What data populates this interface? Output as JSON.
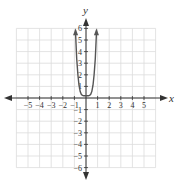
{
  "chart_data": {
    "type": "line",
    "title": "",
    "xlabel": "x",
    "ylabel": "y",
    "xlim": [
      -6,
      6
    ],
    "ylim": [
      -6,
      6
    ],
    "grid": true,
    "x_ticks": [
      "-5",
      "-4",
      "-3",
      "-2",
      "-1",
      "1",
      "2",
      "3",
      "4",
      "5"
    ],
    "y_ticks": [
      "6",
      "5",
      "4",
      "3",
      "2",
      "1",
      "-1",
      "-2",
      "-3",
      "-4",
      "-5",
      "-6"
    ],
    "series": [
      {
        "name": "f(x)",
        "x": [
          -0.9,
          -0.8,
          -0.7,
          -0.6,
          -0.5,
          -0.4,
          -0.3,
          -0.2,
          -0.1,
          0,
          0.1,
          0.2,
          0.3,
          0.4,
          0.5,
          0.6,
          0.7,
          0.8,
          0.9
        ],
        "y": [
          5.5,
          3.4,
          2.0,
          1.1,
          0.55,
          0.3,
          0.22,
          0.2,
          0.2,
          0.2,
          0.2,
          0.2,
          0.22,
          0.3,
          0.55,
          1.1,
          2.0,
          3.4,
          5.5
        ],
        "end_arrows": true,
        "color": "#555555"
      }
    ]
  }
}
